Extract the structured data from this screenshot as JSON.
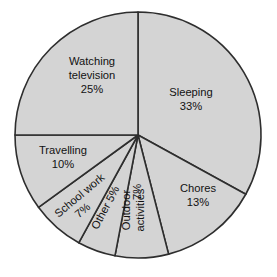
{
  "chart_data": {
    "type": "pie",
    "title": "",
    "subtitle": "",
    "xlabel": "",
    "ylabel": "",
    "legend": false,
    "grid": false,
    "units": "percent",
    "start_angle_deg": 0,
    "direction": "clockwise",
    "categories": [
      "Sleeping",
      "Chores",
      "Outdoor activities",
      "Other",
      "School work",
      "Travelling",
      "Watching television"
    ],
    "values": [
      33,
      13,
      7,
      5,
      7,
      10,
      25
    ],
    "slices": [
      {
        "label": "Sleeping",
        "value": 33,
        "percent_text": "33%",
        "label_lines": [
          "Sleeping",
          "33%"
        ],
        "rotation_deg": 0,
        "label_x": 191,
        "label_y": 100,
        "line_height": 14
      },
      {
        "label": "Chores",
        "value": 13,
        "percent_text": "13%",
        "label_lines": [
          "Chores",
          "13%"
        ],
        "rotation_deg": 0,
        "label_x": 198,
        "label_y": 196,
        "line_height": 14
      },
      {
        "label": "Outdoor activities",
        "value": 7,
        "percent_text": "7%",
        "label_lines": [
          "Outdoor",
          "activities"
        ],
        "rotation_deg": -90,
        "label_x": 134,
        "label_y": 210,
        "line_height": 14,
        "percent_x": 138,
        "percent_y": 192,
        "percent_rotation_deg": -90
      },
      {
        "label": "Other",
        "value": 5,
        "percent_text": "5%",
        "label_lines": [
          "Other 5%"
        ],
        "rotation_deg": -62,
        "label_x": 106,
        "label_y": 208,
        "line_height": 14
      },
      {
        "label": "School work",
        "value": 7,
        "percent_text": "7%",
        "label_lines": [
          "School work"
        ],
        "rotation_deg": -40,
        "label_x": 80,
        "label_y": 196,
        "line_height": 14,
        "percent_x": 83,
        "percent_y": 211,
        "percent_rotation_deg": -40
      },
      {
        "label": "Travelling",
        "value": 10,
        "percent_text": "10%",
        "label_lines": [
          "Travelling",
          "10%"
        ],
        "rotation_deg": 0,
        "label_x": 63,
        "label_y": 158,
        "line_height": 14
      },
      {
        "label": "Watching television",
        "value": 25,
        "percent_text": "25%",
        "label_lines": [
          "Watching",
          "television",
          "25%"
        ],
        "rotation_deg": 0,
        "label_x": 92,
        "label_y": 76,
        "line_height": 14
      }
    ]
  },
  "style": {
    "slice_fill": "#d4d4d4",
    "slice_stroke": "#2e2e2e",
    "background": "#ffffff",
    "text_color": "#121212"
  },
  "geometry": {
    "center_x": 138,
    "center_y": 135,
    "radius": 123
  }
}
